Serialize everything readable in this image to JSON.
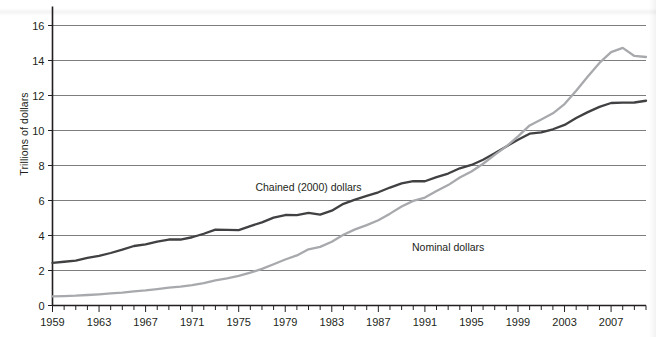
{
  "chart_data": {
    "type": "line",
    "title": "",
    "xlabel": "",
    "ylabel": "Trillions of dollars",
    "xlim": [
      1959,
      2010
    ],
    "ylim": [
      0,
      17
    ],
    "yticks": [
      0,
      2,
      4,
      6,
      8,
      10,
      12,
      14,
      16
    ],
    "ytick_labels": [
      "0",
      "2",
      "4",
      "6",
      "8",
      "10",
      "12",
      "14",
      "16"
    ],
    "xticks": [
      1959,
      1963,
      1967,
      1971,
      1975,
      1979,
      1983,
      1987,
      1991,
      1995,
      1999,
      2003,
      2007
    ],
    "xtick_labels": [
      "1959",
      "1963",
      "1967",
      "1971",
      "1975",
      "1979",
      "1983",
      "1987",
      "1991",
      "1995",
      "1999",
      "2003",
      "2007"
    ],
    "x_minor_tick_interval": 1,
    "grid": "horizontal",
    "legend": "inline-annotations",
    "x": [
      1959,
      1960,
      1961,
      1962,
      1963,
      1964,
      1965,
      1966,
      1967,
      1968,
      1969,
      1970,
      1971,
      1972,
      1973,
      1974,
      1975,
      1976,
      1977,
      1978,
      1979,
      1980,
      1981,
      1982,
      1983,
      1984,
      1985,
      1986,
      1987,
      1988,
      1989,
      1990,
      1991,
      1992,
      1993,
      1994,
      1995,
      1996,
      1997,
      1998,
      1999,
      2000,
      2001,
      2002,
      2003,
      2004,
      2005,
      2006,
      2007,
      2008,
      2009,
      2010
    ],
    "series": [
      {
        "name": "Chained (2000) dollars",
        "color": "#414042",
        "label_x": 1981,
        "label_y": 6.55,
        "values": [
          2.44,
          2.5,
          2.56,
          2.72,
          2.84,
          3.0,
          3.19,
          3.4,
          3.49,
          3.65,
          3.77,
          3.77,
          3.9,
          4.1,
          4.34,
          4.32,
          4.31,
          4.54,
          4.75,
          5.02,
          5.17,
          5.16,
          5.29,
          5.19,
          5.42,
          5.81,
          6.05,
          6.26,
          6.47,
          6.74,
          6.98,
          7.11,
          7.1,
          7.34,
          7.54,
          7.84,
          8.03,
          8.33,
          8.7,
          9.09,
          9.47,
          9.82,
          9.89,
          10.07,
          10.32,
          10.71,
          11.05,
          11.35,
          11.57,
          11.59,
          11.6,
          11.7
        ]
      },
      {
        "name": "Nominal dollars",
        "color": "#a7a9ac",
        "label_x": 1993,
        "label_y": 3.1,
        "values": [
          0.52,
          0.54,
          0.56,
          0.6,
          0.64,
          0.69,
          0.74,
          0.81,
          0.86,
          0.94,
          1.02,
          1.08,
          1.17,
          1.28,
          1.43,
          1.55,
          1.69,
          1.88,
          2.09,
          2.36,
          2.63,
          2.86,
          3.21,
          3.35,
          3.64,
          4.04,
          4.35,
          4.59,
          4.87,
          5.25,
          5.66,
          5.98,
          6.17,
          6.54,
          6.88,
          7.31,
          7.66,
          8.1,
          8.61,
          9.09,
          9.66,
          10.29,
          10.63,
          10.98,
          11.51,
          12.27,
          13.09,
          13.86,
          14.48,
          14.72,
          14.26,
          14.2
        ]
      }
    ]
  }
}
